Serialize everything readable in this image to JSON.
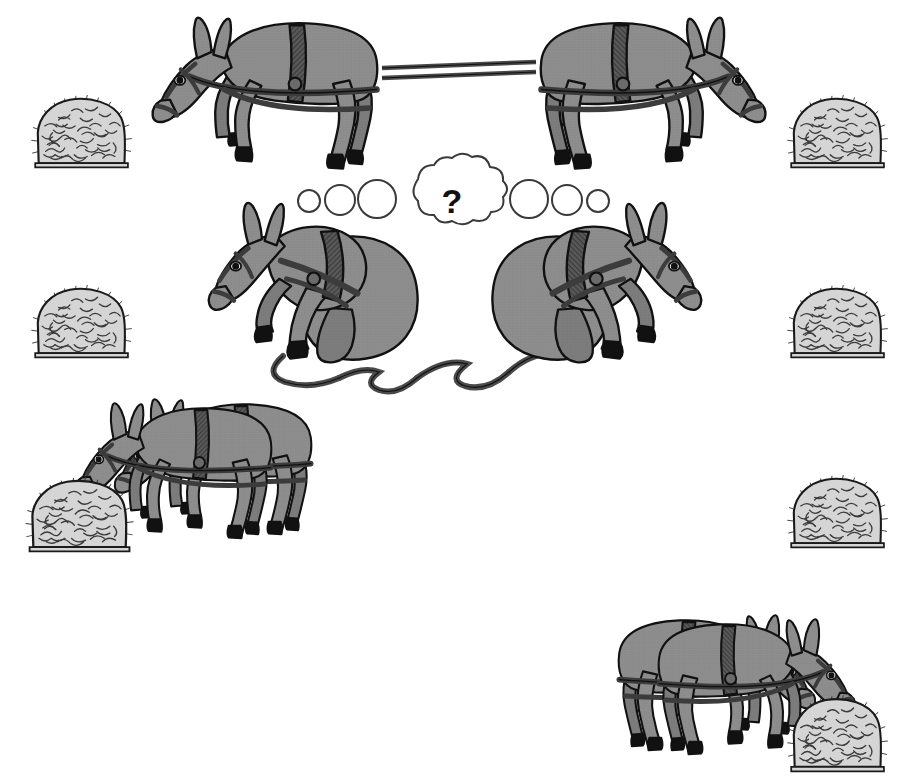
{
  "illustration": {
    "title": "Donkeys and Haystacks Cooperation Puzzle",
    "background_color": "#ffffff",
    "thought_bubble": {
      "symbol": "?",
      "symbol_color": "#111111",
      "outline_color": "#3a3a3a",
      "fill_color": "#ffffff",
      "center_x": 452,
      "center_y": 200,
      "trail_circles_left": [
        {
          "cx": 309,
          "cy": 201,
          "r": 11
        },
        {
          "cx": 339,
          "cy": 200,
          "r": 14
        },
        {
          "cx": 376,
          "cy": 199,
          "r": 18
        }
      ],
      "trail_circles_right": [
        {
          "cx": 529,
          "cy": 199,
          "r": 18
        },
        {
          "cx": 568,
          "cy": 200,
          "r": 14
        },
        {
          "cx": 598,
          "cy": 201,
          "r": 11
        }
      ]
    },
    "palette": {
      "body_gray": "#8e8e8e",
      "body_shade": "#7e7e7e",
      "outline": "#111111",
      "harness_dark": "#4a4a4a",
      "hoof_black": "#111111",
      "hay_fill": "#d5d5d5",
      "hay_stroke": "#3a3a3a",
      "rope": "#555555"
    },
    "haystacks": [
      {
        "name": "haystack-top-left",
        "x": 30,
        "y": 92,
        "w": 104,
        "h": 78
      },
      {
        "name": "haystack-top-right",
        "x": 786,
        "y": 92,
        "w": 104,
        "h": 78
      },
      {
        "name": "haystack-middle-left",
        "x": 30,
        "y": 282,
        "w": 104,
        "h": 78
      },
      {
        "name": "haystack-middle-right",
        "x": 786,
        "y": 282,
        "w": 104,
        "h": 78
      },
      {
        "name": "haystack-lower-left",
        "x": 24,
        "y": 474,
        "w": 112,
        "h": 80
      },
      {
        "name": "haystack-lower-right",
        "x": 786,
        "y": 472,
        "w": 104,
        "h": 78
      },
      {
        "name": "haystack-bottom-right",
        "x": 786,
        "y": 692,
        "w": 104,
        "h": 82
      }
    ],
    "donkey_groups": [
      {
        "name": "top-pair-pulling-apart",
        "description": "Two harnessed donkeys roped together pulling in opposite directions",
        "count": 2,
        "state": "pulling"
      },
      {
        "name": "middle-pair-sitting",
        "description": "Two harnessed donkeys sitting down with slack tangled rope between them",
        "count": 2,
        "state": "sitting"
      },
      {
        "name": "lower-left-pair-eating",
        "description": "Two donkeys walking together eating from shared haystack",
        "count": 2,
        "state": "eating"
      },
      {
        "name": "bottom-right-pair-eating",
        "description": "Two donkeys walking together eating from shared haystack",
        "count": 2,
        "state": "eating"
      }
    ]
  }
}
